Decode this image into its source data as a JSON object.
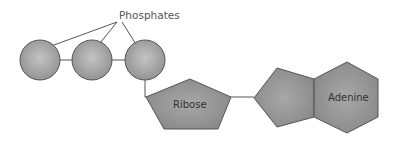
{
  "labels": {
    "phosphates": "Phosphates",
    "ribose": "Ribose",
    "adenine": "Adenine"
  },
  "components": {
    "phosphate_groups": 3,
    "sugar": "Ribose",
    "base": "Adenine"
  },
  "colors": {
    "shape_fill": "#9a9a9a",
    "shape_stroke": "#555555",
    "line": "#555555",
    "text": "#444444"
  }
}
